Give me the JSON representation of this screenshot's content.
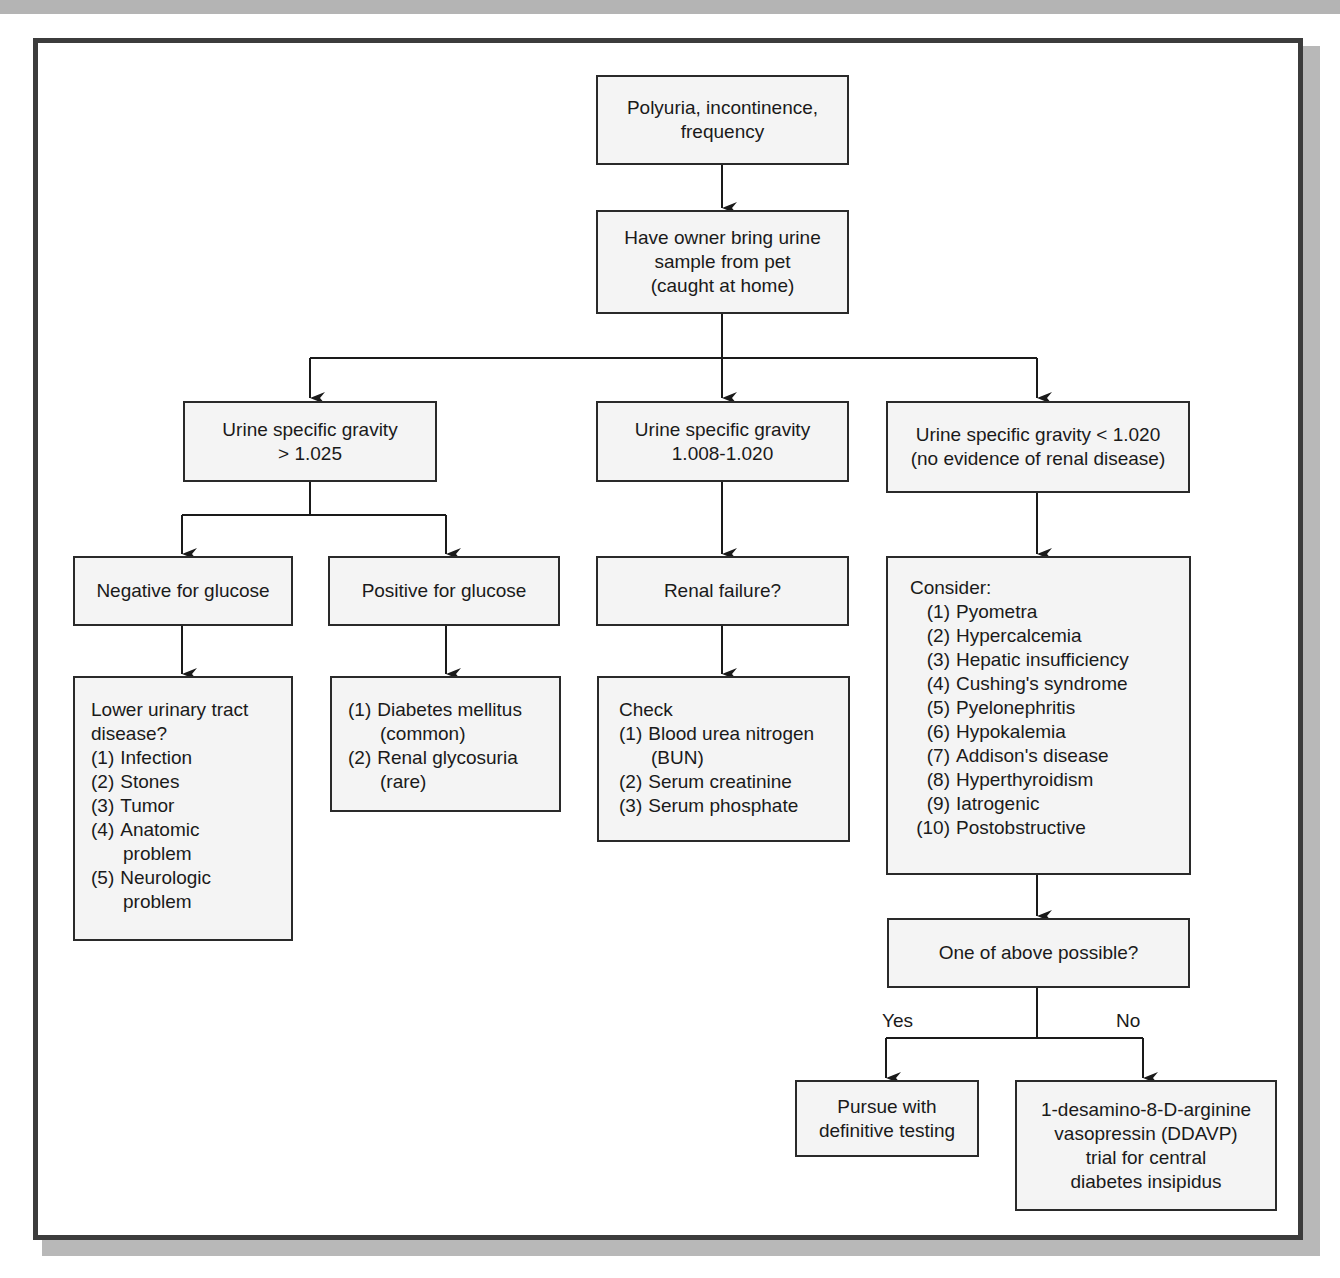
{
  "flowchart": {
    "root": {
      "lines": [
        "Polyuria, incontinence,",
        "frequency"
      ]
    },
    "step2": {
      "lines": [
        "Have owner bring urine",
        "sample from pet",
        "(caught at home)"
      ]
    },
    "sg_high": {
      "lines": [
        "Urine specific gravity",
        "> 1.025"
      ]
    },
    "sg_mid": {
      "lines": [
        "Urine specific gravity",
        "1.008-1.020"
      ]
    },
    "sg_low": {
      "lines": [
        "Urine specific gravity < 1.020",
        "(no evidence of renal disease)"
      ]
    },
    "neg_glucose": {
      "label": "Negative for glucose"
    },
    "pos_glucose": {
      "label": "Positive for glucose"
    },
    "renal_failure": {
      "label": "Renal failure?"
    },
    "lower_urinary": {
      "heading": [
        "Lower urinary tract",
        "disease?"
      ],
      "items": [
        {
          "num": "(1)",
          "text": "Infection"
        },
        {
          "num": "(2)",
          "text": "Stones"
        },
        {
          "num": "(3)",
          "text": "Tumor"
        },
        {
          "num": "(4)",
          "text": "Anatomic",
          "cont": "problem"
        },
        {
          "num": "(5)",
          "text": "Neurologic",
          "cont": "problem"
        }
      ]
    },
    "glucose_causes": {
      "items": [
        {
          "num": "(1)",
          "text": "Diabetes mellitus",
          "cont": "(common)"
        },
        {
          "num": "(2)",
          "text": "Renal glycosuria",
          "cont": "(rare)"
        }
      ]
    },
    "check": {
      "heading": "Check",
      "items": [
        {
          "num": "(1)",
          "text": "Blood urea nitrogen",
          "cont": "(BUN)"
        },
        {
          "num": "(2)",
          "text": "Serum creatinine"
        },
        {
          "num": "(3)",
          "text": "Serum phosphate"
        }
      ]
    },
    "consider": {
      "heading": "Consider:",
      "items": [
        {
          "num": "(1)",
          "text": "Pyometra"
        },
        {
          "num": "(2)",
          "text": "Hypercalcemia"
        },
        {
          "num": "(3)",
          "text": "Hepatic insufficiency"
        },
        {
          "num": "(4)",
          "text": "Cushing's syndrome"
        },
        {
          "num": "(5)",
          "text": "Pyelonephritis"
        },
        {
          "num": "(6)",
          "text": "Hypokalemia"
        },
        {
          "num": "(7)",
          "text": "Addison's disease"
        },
        {
          "num": "(8)",
          "text": "Hyperthyroidism"
        },
        {
          "num": "(9)",
          "text": "Iatrogenic"
        },
        {
          "num": "(10)",
          "text": "Postobstructive"
        }
      ]
    },
    "decision": {
      "label": "One of above possible?"
    },
    "yes_label": "Yes",
    "no_label": "No",
    "pursue": {
      "lines": [
        "Pursue with",
        "definitive testing"
      ]
    },
    "ddavp": {
      "lines": [
        "1-desamino-8-D-arginine",
        "vasopressin (DDAVP)",
        "trial for central",
        "diabetes insipidus"
      ]
    }
  },
  "colors": {
    "box_fill": "#f4f4f4",
    "box_border": "#2a2a2a",
    "frame_border": "#3c3c3c",
    "shadow": "#b8b8b8"
  }
}
